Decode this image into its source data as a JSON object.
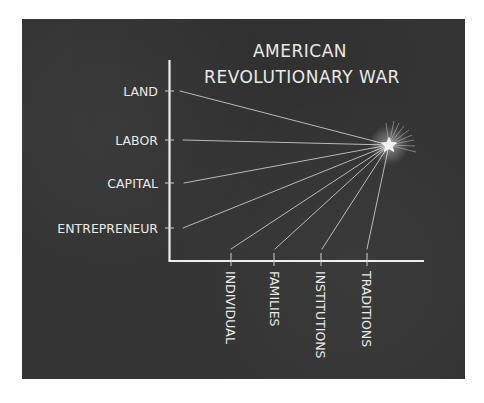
{
  "title": {
    "line1": "AMERICAN",
    "line2": "REVOLUTIONARY WAR"
  },
  "y_axis": {
    "labels": [
      "LAND",
      "LABOR",
      "CAPITAL",
      "ENTREPRENEUR"
    ]
  },
  "x_axis": {
    "labels": [
      "INDIVIDUAL",
      "FAMILIES",
      "INSTITUTIONS",
      "TRADITIONS"
    ]
  },
  "focal_point": {
    "icon": "star-icon",
    "description": "star where all lines converge"
  },
  "colors": {
    "board": "#343434",
    "chalk": "#e9e9e9"
  }
}
